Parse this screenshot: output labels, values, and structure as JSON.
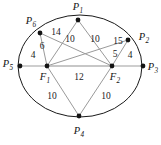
{
  "figure": {
    "type": "geometry-diagram",
    "colors": {
      "ellipse_stroke": "#1a1a1a",
      "chord_gray": "#9a9a9a",
      "chord_dark": "#6e6e6e",
      "axis_line": "#b4b4b4",
      "node_fill": "#141414",
      "text": "#1a1a1a",
      "background": "#ffffff"
    }
  },
  "vertices": [
    {
      "id": "P1",
      "base": "P",
      "sub": "1",
      "x": 78,
      "y": 20,
      "label_x": 78,
      "label_y": 8
    },
    {
      "id": "P2",
      "base": "P",
      "sub": "2",
      "x": 128,
      "y": 40,
      "label_x": 144,
      "label_y": 38
    },
    {
      "id": "P3",
      "base": "P",
      "sub": "3",
      "x": 143,
      "y": 66,
      "label_x": 153,
      "label_y": 68
    },
    {
      "id": "P4",
      "base": "P",
      "sub": "4",
      "x": 79,
      "y": 116,
      "label_x": 79,
      "label_y": 132
    },
    {
      "id": "P5",
      "base": "P",
      "sub": "5",
      "x": 20,
      "y": 66,
      "label_x": 8,
      "label_y": 65
    },
    {
      "id": "P6",
      "base": "P",
      "sub": "6",
      "x": 40,
      "y": 33,
      "label_x": 31,
      "label_y": 22
    },
    {
      "id": "F1",
      "base": "F",
      "sub": "1",
      "x": 47,
      "y": 66,
      "label_x": 45,
      "label_y": 78
    },
    {
      "id": "F2",
      "base": "F",
      "sub": "2",
      "x": 112,
      "y": 66,
      "label_x": 115,
      "label_y": 78
    }
  ],
  "edges": [
    {
      "id": "P6-F2",
      "from": "P6",
      "to": "F2",
      "weight": "14",
      "label_x": 56,
      "label_y": 33,
      "style": "chord-gray"
    },
    {
      "id": "P6-F1",
      "from": "P6",
      "to": "F1",
      "weight": "6",
      "label_x": 42,
      "label_y": 47,
      "style": "chord-gray"
    },
    {
      "id": "P5-F1",
      "from": "P5",
      "to": "F1",
      "weight": "4",
      "label_x": 33,
      "label_y": 56,
      "style": "axis-line"
    },
    {
      "id": "P1-F1",
      "from": "P1",
      "to": "F1",
      "weight": "10",
      "label_x": 70,
      "label_y": 40,
      "style": "chord-gray"
    },
    {
      "id": "P1-F2",
      "from": "P1",
      "to": "F2",
      "weight": "10",
      "label_x": 95,
      "label_y": 40,
      "style": "chord-gray"
    },
    {
      "id": "P2-F1",
      "from": "P2",
      "to": "F1",
      "weight": "15",
      "label_x": 118,
      "label_y": 42,
      "style": "chord-gray"
    },
    {
      "id": "P2-F2",
      "from": "P2",
      "to": "F2",
      "weight": "5",
      "label_x": 115,
      "label_y": 55,
      "style": "chord-gray"
    },
    {
      "id": "F2-P3",
      "from": "F2",
      "to": "P3",
      "weight": "4",
      "label_x": 130,
      "label_y": 56,
      "style": "axis-line"
    },
    {
      "id": "F1-F2",
      "from": "F1",
      "to": "F2",
      "weight": "12",
      "label_x": 79,
      "label_y": 78,
      "style": "axis-line"
    },
    {
      "id": "F1-P4",
      "from": "F1",
      "to": "P4",
      "weight": "10",
      "label_x": 52,
      "label_y": 97,
      "style": "chord-gray"
    },
    {
      "id": "F2-P4",
      "from": "F2",
      "to": "P4",
      "weight": "10",
      "label_x": 106,
      "label_y": 97,
      "style": "chord-gray"
    }
  ],
  "ellipse": {
    "cx": 80,
    "cy": 66,
    "rx": 62,
    "ry": 51
  }
}
